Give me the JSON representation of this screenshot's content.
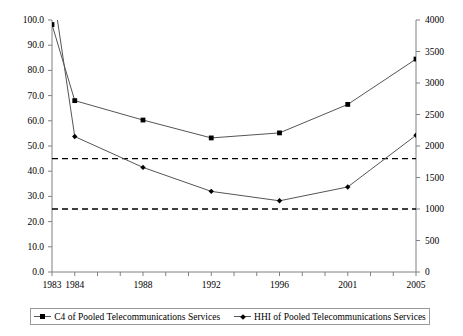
{
  "chart_data": {
    "type": "line",
    "title": "",
    "subtitle": "",
    "xlabel": "",
    "ylabel": "",
    "grid": false,
    "legend_position": "bottom",
    "x_categories": [
      "1983",
      "1984",
      "1988",
      "1992",
      "1996",
      "2001",
      "2005"
    ],
    "x_tick_labels": [
      "1983",
      "1984",
      "1988",
      "1992",
      "1996",
      "2001",
      "2005"
    ],
    "left_axis": {
      "label": "",
      "ylim": [
        0.0,
        100.0
      ],
      "tick_labels": [
        "0.0",
        "10.0",
        "20.0",
        "30.0",
        "40.0",
        "50.0",
        "60.0",
        "70.0",
        "80.0",
        "90.0",
        "100.0"
      ],
      "tick_values": [
        0,
        10,
        20,
        30,
        40,
        50,
        60,
        70,
        80,
        90,
        100
      ]
    },
    "right_axis": {
      "label": "",
      "ylim": [
        0,
        4000
      ],
      "tick_labels": [
        "0",
        "500",
        "1000",
        "1500",
        "2000",
        "2500",
        "3000",
        "3500",
        "4000"
      ],
      "tick_values": [
        0,
        500,
        1000,
        1500,
        2000,
        2500,
        3000,
        3500,
        4000
      ]
    },
    "series": [
      {
        "name": "C4 of  Pooled Telecommunications Services",
        "axis": "left",
        "marker": "square",
        "color": "#555555",
        "x": [
          "1983",
          "1984",
          "1988",
          "1992",
          "1996",
          "2001",
          "2005"
        ],
        "values": [
          98.2,
          68.0,
          60.3,
          53.2,
          55.2,
          66.5,
          84.5
        ]
      },
      {
        "name": "HHI of Pooled Telecommunications Services",
        "axis": "right",
        "marker": "diamond",
        "color": "#555555",
        "x": [
          "1983",
          "1984",
          "1988",
          "1992",
          "1996",
          "2001",
          "2005"
        ],
        "values": [
          4580,
          2150,
          1660,
          1280,
          1130,
          1350,
          2170
        ],
        "note_clipped": "1983 value exceeds the plotted range and is drawn off the top of the axis"
      }
    ],
    "threshold_lines": [
      {
        "name": "upper-threshold",
        "left_value": 45.0,
        "right_value": 1800,
        "style": "dashed"
      },
      {
        "name": "lower-threshold",
        "left_value": 25.0,
        "right_value": 1000,
        "style": "dashed"
      }
    ]
  },
  "legend": {
    "entries": [
      {
        "label": "C4 of  Pooled Telecommunications Services",
        "marker": "square"
      },
      {
        "label": "HHI of Pooled Telecommunications Services",
        "marker": "diamond"
      }
    ]
  }
}
